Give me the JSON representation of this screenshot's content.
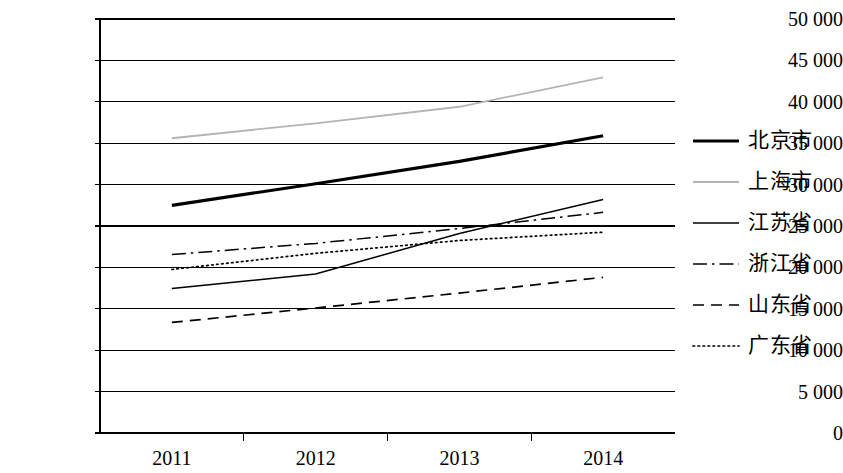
{
  "chart_data": {
    "type": "line",
    "title": "",
    "subtitle": "",
    "xlabel": "",
    "ylabel": "",
    "categories": [
      "2011",
      "2012",
      "2013",
      "2014"
    ],
    "ylim": [
      0,
      50000
    ],
    "ytick_labels": [
      "50 000",
      "45 000",
      "40 000",
      "35 000",
      "30 000",
      "25 000",
      "20 000",
      "15 000",
      "10 000",
      "5 000",
      "0"
    ],
    "ytick_values": [
      50000,
      45000,
      40000,
      35000,
      30000,
      25000,
      20000,
      15000,
      10000,
      5000,
      0
    ],
    "grid": true,
    "grid_axis": "y",
    "legend_position": "right",
    "series": [
      {
        "name": "北京市",
        "values": [
          27500,
          30100,
          32800,
          35900
        ],
        "style": "solid",
        "width": 3.2,
        "color": "#000000"
      },
      {
        "name": "上海市",
        "values": [
          35600,
          37400,
          39400,
          42950
        ],
        "style": "solid",
        "width": 1.8,
        "color": "#b4b4b4"
      },
      {
        "name": "江苏省",
        "values": [
          17450,
          19200,
          24100,
          28200
        ],
        "style": "solid",
        "width": 1.5,
        "color": "#000000"
      },
      {
        "name": "浙江省",
        "values": [
          21550,
          22900,
          24700,
          26650
        ],
        "style": "dashdot",
        "width": 1.5,
        "color": "#000000"
      },
      {
        "name": "山东省",
        "values": [
          13350,
          15100,
          16900,
          18800
        ],
        "style": "dashed",
        "width": 1.7,
        "color": "#000000"
      },
      {
        "name": "广东省",
        "values": [
          19750,
          21700,
          23250,
          24250
        ],
        "style": "dotted",
        "width": 1.7,
        "color": "#000000"
      }
    ]
  },
  "axes": {
    "y_ticks": [
      {
        "label": "50 000"
      },
      {
        "label": "45 000"
      },
      {
        "label": "40 000"
      },
      {
        "label": "35 000"
      },
      {
        "label": "30 000"
      },
      {
        "label": "25 000"
      },
      {
        "label": "20 000"
      },
      {
        "label": "15 000"
      },
      {
        "label": "10 000"
      },
      {
        "label": "5 000"
      },
      {
        "label": "0"
      }
    ],
    "x_ticks": [
      {
        "label": "2011"
      },
      {
        "label": "2012"
      },
      {
        "label": "2013"
      },
      {
        "label": "2014"
      }
    ]
  },
  "legend": {
    "items": [
      {
        "label": "北京市"
      },
      {
        "label": "上海市"
      },
      {
        "label": "江苏省"
      },
      {
        "label": "浙江省"
      },
      {
        "label": "山东省"
      },
      {
        "label": "广东省"
      }
    ]
  }
}
